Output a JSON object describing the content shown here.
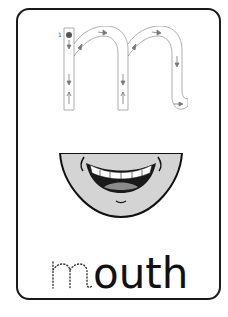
{
  "card": {
    "border_color": "#1a1a1a",
    "background": "#ffffff"
  },
  "tracing_letter": {
    "letter": "m",
    "start_number": "1",
    "icons": [
      "start-dot-icon",
      "arrow-down-icon",
      "arrow-up-icon",
      "arrow-right-icon"
    ]
  },
  "picture": {
    "subject": "mouth",
    "description": "smiling mouth with teeth"
  },
  "word": {
    "traced_letter": "m",
    "rest": "outh",
    "full": "mouth"
  }
}
